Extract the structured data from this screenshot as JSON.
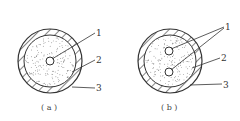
{
  "figures": [
    {
      "id": "a",
      "caption": "( a )",
      "core_count": 1,
      "labels": [
        "1",
        "2",
        "3"
      ]
    },
    {
      "id": "b",
      "caption": "( b )",
      "core_count": 2,
      "labels": [
        "1",
        "2",
        "3"
      ]
    }
  ],
  "colors": {
    "stroke": "#333333",
    "dots": "#666666",
    "background": "#ffffff"
  }
}
